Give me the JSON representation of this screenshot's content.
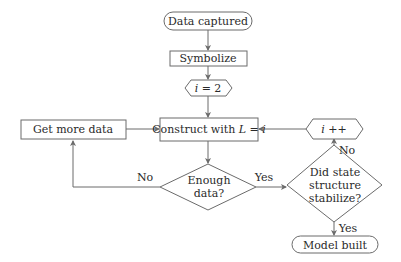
{
  "diagram": {
    "type": "flowchart",
    "colors": {
      "stroke": "#6b6b6b",
      "text": "#2a2a2a",
      "background": "#ffffff"
    },
    "nodes": {
      "start": {
        "shape": "terminator",
        "label": "Data captured"
      },
      "symbolize": {
        "shape": "process",
        "label": "Symbolize"
      },
      "init": {
        "shape": "hexagon",
        "label_var": "i",
        "label_rest": " = 2"
      },
      "get_more": {
        "shape": "process",
        "label": "Get more data"
      },
      "construct": {
        "shape": "process",
        "label_prefix": "Construct with ",
        "label_var1": "L",
        "label_mid": " = ",
        "label_var2": "i"
      },
      "increment": {
        "shape": "hexagon",
        "label_var": "i",
        "label_rest": " ++"
      },
      "enough": {
        "shape": "decision",
        "line1": "Enough",
        "line2": "data?"
      },
      "stabilize": {
        "shape": "decision",
        "line1": "Did state",
        "line2": "structure",
        "line3": "stabilize?"
      },
      "end": {
        "shape": "terminator",
        "label": "Model built"
      }
    },
    "edges": [
      {
        "from": "start",
        "to": "symbolize",
        "label": ""
      },
      {
        "from": "symbolize",
        "to": "init",
        "label": ""
      },
      {
        "from": "init",
        "to": "construct",
        "label": ""
      },
      {
        "from": "get_more",
        "to": "construct",
        "label": ""
      },
      {
        "from": "construct",
        "to": "enough",
        "label": ""
      },
      {
        "from": "enough",
        "to": "get_more",
        "label": "No"
      },
      {
        "from": "enough",
        "to": "stabilize",
        "label": "Yes"
      },
      {
        "from": "stabilize",
        "to": "increment",
        "label": "No"
      },
      {
        "from": "increment",
        "to": "construct",
        "label": ""
      },
      {
        "from": "stabilize",
        "to": "end",
        "label": "Yes"
      }
    ],
    "edge_labels": {
      "enough_no": "No",
      "enough_yes": "Yes",
      "stabilize_no": "No",
      "stabilize_yes": "Yes"
    }
  }
}
